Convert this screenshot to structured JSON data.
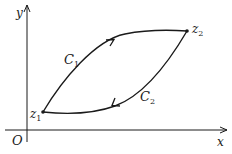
{
  "diagram": {
    "type": "complex-plane-contour",
    "axes": {
      "x_label": "x",
      "y_label": "y",
      "origin_label": "O"
    },
    "points": [
      {
        "id": "z1",
        "name": "z",
        "sub": "1"
      },
      {
        "id": "z2",
        "name": "z",
        "sub": "2"
      }
    ],
    "curves": [
      {
        "id": "C1",
        "name": "C",
        "sub": "1",
        "from": "z1",
        "to": "z2",
        "direction": "z1 to z2 (upper arc)"
      },
      {
        "id": "C2",
        "name": "C",
        "sub": "2",
        "from": "z2",
        "to": "z1",
        "direction": "z2 to z1 (lower arc)"
      }
    ],
    "colors": {
      "stroke": "#1a1a1a",
      "background": "#ffffff"
    }
  }
}
